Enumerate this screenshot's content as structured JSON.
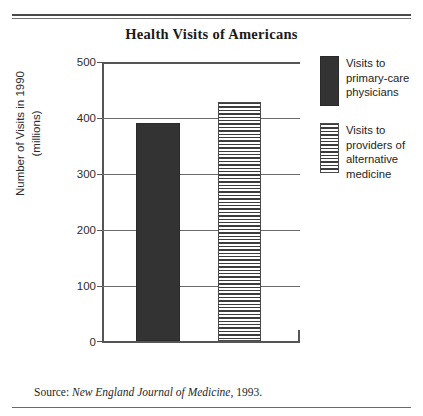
{
  "chart_data": {
    "type": "bar",
    "title": "Health Visits of Americans",
    "categories": [
      "Visits to primary-care physicians",
      "Visits to providers of alternative medicine"
    ],
    "values": [
      388,
      425
    ],
    "xlabel": "",
    "ylabel": "Number of Visits in 1990\n(millions)",
    "ylim": [
      0,
      500
    ],
    "yticks": [
      500,
      400,
      300,
      200,
      100,
      0
    ],
    "grid": true,
    "legend_position": "right",
    "series": [
      {
        "name": "Visits to primary-care physicians",
        "value": 388,
        "fill": "solid",
        "color": "#333333"
      },
      {
        "name": "Visits to providers of alternative medicine",
        "value": 425,
        "fill": "horizontal-stripes",
        "color": "#3c3c3c"
      }
    ]
  },
  "title": "Health Visits of Americans",
  "axis": {
    "y_title_line1": "Number of Visits in 1990",
    "y_title_line2": "(millions)",
    "ticks": [
      "500",
      "400",
      "300",
      "200",
      "100",
      "0"
    ]
  },
  "legend": {
    "items": [
      {
        "label": "Visits to\nprimary-care\nphysicians",
        "swatch": "solid-dark"
      },
      {
        "label": "Visits to\nproviders of\nalternative\nmedicine",
        "swatch": "striped"
      }
    ]
  },
  "source": {
    "prefix": "Source: ",
    "publication": "New England Journal of Medicine",
    "suffix": ", 1993."
  }
}
